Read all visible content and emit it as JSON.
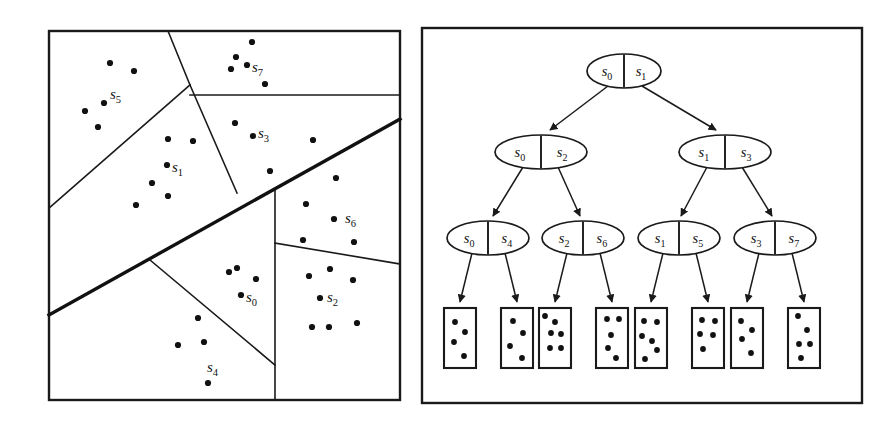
{
  "figure": {
    "panels": [
      {
        "name": "partition-panel",
        "x": 49,
        "y": 31,
        "width": 351,
        "height": 369
      },
      {
        "name": "tree-panel",
        "x": 422,
        "y": 28,
        "width": 440,
        "height": 375
      }
    ]
  },
  "partition": {
    "region_labels": [
      {
        "id": "s5",
        "base": "s",
        "sub": "5",
        "x": 110,
        "y": 99
      },
      {
        "id": "s7",
        "base": "s",
        "sub": "7",
        "x": 252,
        "y": 72
      },
      {
        "id": "s3",
        "base": "s",
        "sub": "3",
        "x": 258,
        "y": 138
      },
      {
        "id": "s1",
        "base": "s",
        "sub": "1",
        "x": 172,
        "y": 172
      },
      {
        "id": "s6",
        "base": "s",
        "sub": "6",
        "x": 345,
        "y": 223
      },
      {
        "id": "s0",
        "base": "s",
        "sub": "0",
        "x": 246,
        "y": 302
      },
      {
        "id": "s2",
        "base": "s",
        "sub": "2",
        "x": 327,
        "y": 302
      },
      {
        "id": "s4",
        "base": "s",
        "sub": "4",
        "x": 207,
        "y": 372
      }
    ],
    "boundaries": [
      {
        "name": "s5-s1-divider",
        "weight": "thin",
        "points": "49,208 190,85"
      },
      {
        "name": "s7-top-divider",
        "weight": "thin",
        "points": "190,85 168,31"
      },
      {
        "name": "s1-s3-divider",
        "weight": "thin",
        "points": "190,85 237,193"
      },
      {
        "name": "s7-s3-divider",
        "weight": "thin",
        "points": "190,95 400,95"
      },
      {
        "name": "upper-lower-main-divider",
        "weight": "thick",
        "points": "49,315 400,119"
      },
      {
        "name": "s0-s4-divider",
        "weight": "thin",
        "points": "150,260 275,365"
      },
      {
        "name": "s0-s2-divider",
        "weight": "thin",
        "points": "275,190 275,400"
      },
      {
        "name": "s6-s2-divider",
        "weight": "thin",
        "points": "275,243 400,264"
      }
    ],
    "points": [
      {
        "x": 110,
        "y": 63
      },
      {
        "x": 134,
        "y": 71
      },
      {
        "x": 104,
        "y": 103
      },
      {
        "x": 85,
        "y": 111
      },
      {
        "x": 98,
        "y": 127
      },
      {
        "x": 252,
        "y": 42
      },
      {
        "x": 236,
        "y": 57
      },
      {
        "x": 231,
        "y": 69
      },
      {
        "x": 247,
        "y": 65
      },
      {
        "x": 265,
        "y": 84
      },
      {
        "x": 235,
        "y": 123
      },
      {
        "x": 253,
        "y": 136
      },
      {
        "x": 313,
        "y": 140
      },
      {
        "x": 270,
        "y": 171
      },
      {
        "x": 168,
        "y": 139
      },
      {
        "x": 193,
        "y": 141
      },
      {
        "x": 167,
        "y": 165
      },
      {
        "x": 152,
        "y": 183
      },
      {
        "x": 168,
        "y": 196
      },
      {
        "x": 136,
        "y": 205
      },
      {
        "x": 336,
        "y": 178
      },
      {
        "x": 306,
        "y": 204
      },
      {
        "x": 334,
        "y": 219
      },
      {
        "x": 303,
        "y": 240
      },
      {
        "x": 354,
        "y": 242
      },
      {
        "x": 229,
        "y": 272
      },
      {
        "x": 237,
        "y": 268
      },
      {
        "x": 256,
        "y": 279
      },
      {
        "x": 241,
        "y": 295
      },
      {
        "x": 198,
        "y": 318
      },
      {
        "x": 178,
        "y": 345
      },
      {
        "x": 204,
        "y": 342
      },
      {
        "x": 208,
        "y": 383
      },
      {
        "x": 309,
        "y": 276
      },
      {
        "x": 330,
        "y": 269
      },
      {
        "x": 353,
        "y": 280
      },
      {
        "x": 320,
        "y": 298
      },
      {
        "x": 312,
        "y": 327
      },
      {
        "x": 329,
        "y": 327
      },
      {
        "x": 357,
        "y": 323
      }
    ]
  },
  "tree": {
    "levels": [
      {
        "name": "root-level",
        "nodes": [
          {
            "id": "root",
            "cx": 624,
            "cy": 71,
            "rx": 37,
            "ry": 17,
            "left": {
              "base": "s",
              "sub": "0"
            },
            "right": {
              "base": "s",
              "sub": "1"
            }
          }
        ]
      },
      {
        "name": "level-2",
        "nodes": [
          {
            "id": "n-s0s2",
            "cx": 541,
            "cy": 152,
            "rx": 46,
            "ry": 17,
            "left": {
              "base": "s",
              "sub": "0"
            },
            "right": {
              "base": "s",
              "sub": "2"
            }
          },
          {
            "id": "n-s1s3",
            "cx": 725,
            "cy": 152,
            "rx": 46,
            "ry": 17,
            "left": {
              "base": "s",
              "sub": "1"
            },
            "right": {
              "base": "s",
              "sub": "3"
            }
          }
        ]
      },
      {
        "name": "level-3",
        "nodes": [
          {
            "id": "n-s0s4",
            "cx": 488,
            "cy": 238,
            "rx": 41,
            "ry": 17,
            "left": {
              "base": "s",
              "sub": "0"
            },
            "right": {
              "base": "s",
              "sub": "4"
            }
          },
          {
            "id": "n-s2s6",
            "cx": 583,
            "cy": 238,
            "rx": 41,
            "ry": 17,
            "left": {
              "base": "s",
              "sub": "2"
            },
            "right": {
              "base": "s",
              "sub": "6"
            }
          },
          {
            "id": "n-s1s5",
            "cx": 679,
            "cy": 238,
            "rx": 41,
            "ry": 17,
            "left": {
              "base": "s",
              "sub": "1"
            },
            "right": {
              "base": "s",
              "sub": "5"
            }
          },
          {
            "id": "n-s3s7",
            "cx": 775,
            "cy": 238,
            "rx": 41,
            "ry": 17,
            "left": {
              "base": "s",
              "sub": "3"
            },
            "right": {
              "base": "s",
              "sub": "7"
            }
          }
        ]
      }
    ],
    "edges": [
      {
        "name": "edge-root-to-s0s2",
        "x1": 608,
        "y1": 86,
        "x2": 550,
        "y2": 130
      },
      {
        "name": "edge-root-to-s1s3",
        "x1": 642,
        "y1": 86,
        "x2": 716,
        "y2": 130
      },
      {
        "name": "edge-s0s2-to-s0s4",
        "x1": 523,
        "y1": 167,
        "x2": 493,
        "y2": 216
      },
      {
        "name": "edge-s0s2-to-s2s6",
        "x1": 558,
        "y1": 167,
        "x2": 580,
        "y2": 216
      },
      {
        "name": "edge-s1s3-to-s1s5",
        "x1": 707,
        "y1": 167,
        "x2": 681,
        "y2": 216
      },
      {
        "name": "edge-s1s3-to-s3s7",
        "x1": 742,
        "y1": 167,
        "x2": 772,
        "y2": 216
      },
      {
        "name": "edge-s0s4-to-leaf-1",
        "x1": 472,
        "y1": 253,
        "x2": 460,
        "y2": 302
      },
      {
        "name": "edge-s0s4-to-leaf-2",
        "x1": 505,
        "y1": 253,
        "x2": 517,
        "y2": 302
      },
      {
        "name": "edge-s2s6-to-leaf-3",
        "x1": 567,
        "y1": 253,
        "x2": 555,
        "y2": 302
      },
      {
        "name": "edge-s2s6-to-leaf-4",
        "x1": 600,
        "y1": 253,
        "x2": 612,
        "y2": 302
      },
      {
        "name": "edge-s1s5-to-leaf-5",
        "x1": 663,
        "y1": 253,
        "x2": 651,
        "y2": 302
      },
      {
        "name": "edge-s1s5-to-leaf-6",
        "x1": 696,
        "y1": 253,
        "x2": 708,
        "y2": 302
      },
      {
        "name": "edge-s3s7-to-leaf-7",
        "x1": 759,
        "y1": 253,
        "x2": 747,
        "y2": 302
      },
      {
        "name": "edge-s3s7-to-leaf-8",
        "x1": 792,
        "y1": 253,
        "x2": 804,
        "y2": 302
      }
    ],
    "leaves": [
      {
        "id": "leaf-1",
        "x": 444,
        "y": 308,
        "w": 32,
        "h": 60,
        "points": [
          [
            11,
            14
          ],
          [
            21,
            24
          ],
          [
            10,
            34
          ],
          [
            20,
            48
          ]
        ]
      },
      {
        "id": "leaf-2",
        "x": 501,
        "y": 308,
        "w": 32,
        "h": 60,
        "points": [
          [
            12,
            13
          ],
          [
            22,
            25
          ],
          [
            9,
            38
          ],
          [
            21,
            50
          ]
        ]
      },
      {
        "id": "leaf-3",
        "x": 539,
        "y": 308,
        "w": 32,
        "h": 60,
        "points": [
          [
            6,
            8
          ],
          [
            16,
            14
          ],
          [
            12,
            25
          ],
          [
            22,
            26
          ],
          [
            11,
            40
          ],
          [
            22,
            40
          ]
        ]
      },
      {
        "id": "leaf-4",
        "x": 596,
        "y": 308,
        "w": 32,
        "h": 60,
        "points": [
          [
            11,
            11
          ],
          [
            23,
            11
          ],
          [
            15,
            27
          ],
          [
            12,
            40
          ],
          [
            20,
            50
          ]
        ]
      },
      {
        "id": "leaf-5",
        "x": 635,
        "y": 308,
        "w": 32,
        "h": 60,
        "points": [
          [
            9,
            13
          ],
          [
            22,
            14
          ],
          [
            7,
            28
          ],
          [
            17,
            33
          ],
          [
            22,
            42
          ],
          [
            10,
            51
          ]
        ]
      },
      {
        "id": "leaf-6",
        "x": 692,
        "y": 308,
        "w": 32,
        "h": 60,
        "points": [
          [
            10,
            12
          ],
          [
            23,
            13
          ],
          [
            8,
            26
          ],
          [
            21,
            27
          ],
          [
            11,
            41
          ]
        ]
      },
      {
        "id": "leaf-7",
        "x": 731,
        "y": 308,
        "w": 32,
        "h": 60,
        "points": [
          [
            10,
            13
          ],
          [
            21,
            22
          ],
          [
            11,
            31
          ],
          [
            20,
            45
          ]
        ]
      },
      {
        "id": "leaf-8",
        "x": 788,
        "y": 308,
        "w": 32,
        "h": 60,
        "points": [
          [
            10,
            8
          ],
          [
            19,
            22
          ],
          [
            11,
            36
          ],
          [
            22,
            36
          ],
          [
            13,
            50
          ]
        ]
      }
    ]
  }
}
